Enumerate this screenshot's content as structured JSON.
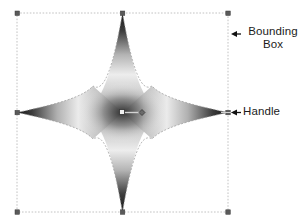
{
  "canvas": {
    "background_color": "#ffffff",
    "width": 306,
    "height": 220
  },
  "selection": {
    "bounding_box": {
      "left": 17,
      "top": 13,
      "right": 228,
      "bottom": 212,
      "stroke_color": "#bdbdbd",
      "stroke_style": "dotted"
    },
    "handle_color": "#555555",
    "handle_size": 4,
    "handles": [
      {
        "name": "handle-top-left",
        "x": 17,
        "y": 13
      },
      {
        "name": "handle-top-center",
        "x": 122.5,
        "y": 13
      },
      {
        "name": "handle-top-right",
        "x": 228,
        "y": 13
      },
      {
        "name": "handle-middle-left",
        "x": 17,
        "y": 112.5
      },
      {
        "name": "handle-middle-right",
        "x": 228,
        "y": 112.5
      },
      {
        "name": "handle-bottom-left",
        "x": 17,
        "y": 212
      },
      {
        "name": "handle-bottom-center",
        "x": 122.5,
        "y": 212
      },
      {
        "name": "handle-bottom-right",
        "x": 228,
        "y": 212
      }
    ]
  },
  "shape": {
    "type": "four-pointed-star",
    "center_x": 122.5,
    "center_y": 112.5,
    "fill": "gradient-grayscale",
    "gradient_dark": "#1a1a1a",
    "gradient_light": "#f7f7f7",
    "outline_color": "#8c8c8c"
  },
  "gradient_handle": {
    "square_x": 122,
    "square_y": 112.5,
    "diamond_x": 142,
    "diamond_y": 112.5,
    "line_color": "#d8d8d8",
    "node_color": "#4a4a4a"
  },
  "annotations": [
    {
      "name": "bounding-box",
      "line1": "Bounding",
      "line2": "Box",
      "arrow": "arrow-left",
      "arrow_color": "#111111",
      "text_color": "#1b1b1b"
    },
    {
      "name": "handle",
      "line1": "Handle",
      "line2": "",
      "arrow": "arrow-left",
      "arrow_color": "#111111",
      "text_color": "#1b1b1b"
    }
  ]
}
